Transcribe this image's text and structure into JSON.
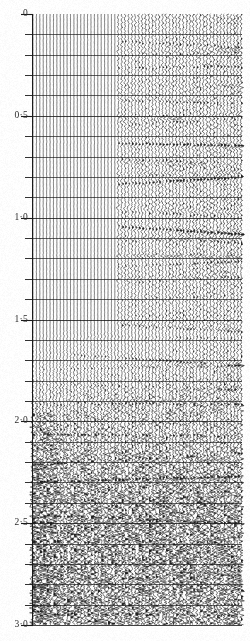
{
  "figure": {
    "kind": "seismic-section",
    "background_color": "#fefefe",
    "ink_color": "#1a1a1a",
    "width_px": 250,
    "height_px": 641
  },
  "axis": {
    "name": "two-way-travel-time",
    "orientation": "vertical",
    "units_implied": "seconds",
    "decimal_separator": "·",
    "major_labels": [
      "0",
      "0·5",
      "1·0",
      "1·5",
      "2·0",
      "2·5",
      "3·0"
    ],
    "major_values": [
      0,
      0.5,
      1.0,
      1.5,
      2.0,
      2.5,
      3.0
    ],
    "minor_interval": 0.1,
    "range": [
      0,
      3.0
    ],
    "label_x_right_px": 28,
    "axis_x_px": 32,
    "top_y_px": 14,
    "bottom_y_px": 625,
    "major_tick_length_px": 11,
    "minor_tick_length_px": 7
  },
  "chart_data": {
    "type": "line",
    "title": "",
    "xlabel": "",
    "ylabel": "Two-way travel time (s)",
    "ylim": [
      0,
      3.0
    ],
    "grid": true,
    "legend": "none",
    "traces": {
      "count": 62,
      "first_x_px": 33,
      "last_x_px": 241,
      "spacing_px": 3.4,
      "polarity": "variable-area-wiggle"
    },
    "gridlines_horizontal": {
      "interval_seconds": 0.1,
      "values": [
        0.1,
        0.2,
        0.3,
        0.4,
        0.5,
        0.6,
        0.7,
        0.8,
        0.9,
        1.0,
        1.1,
        1.2,
        1.3,
        1.4,
        1.5,
        1.6,
        1.7,
        1.8,
        1.9,
        2.0,
        2.1,
        2.2,
        2.3,
        2.4,
        2.5,
        2.6,
        2.7,
        2.8,
        2.9,
        3.0
      ]
    },
    "zones": [
      {
        "name": "quiet-upper-left",
        "x_range_px": [
          33,
          118
        ],
        "t_range_s": [
          0.0,
          1.55
        ],
        "description": "near-vertical low amplitude traces, strong horizontal ruling",
        "amplitude": 0.1,
        "noise": 0.08
      },
      {
        "name": "reflective-upper-right",
        "x_range_px": [
          118,
          241
        ],
        "t_range_s": [
          0.08,
          1.55
        ],
        "description": "coherent dark wiggle events with lateral continuity",
        "amplitude": 0.85,
        "noise": 0.35
      },
      {
        "name": "transition-mid",
        "x_range_px": [
          33,
          241
        ],
        "t_range_s": [
          1.55,
          1.95
        ],
        "description": "amplitude growth ramping toward the left edge",
        "amplitude": 0.55,
        "noise": 0.45
      },
      {
        "name": "noisy-lower",
        "x_range_px": [
          33,
          241
        ],
        "t_range_s": [
          1.95,
          3.0
        ],
        "description": "high amplitude incoherent reflections, dense banding",
        "amplitude": 1.0,
        "noise": 0.85
      }
    ],
    "reflector_events_s": [
      0.12,
      0.2,
      0.27,
      0.33,
      0.41,
      0.48,
      0.56,
      0.63,
      0.71,
      0.79,
      0.86,
      0.94,
      1.02,
      1.1,
      1.18,
      1.26,
      1.34,
      1.42,
      1.5,
      1.58,
      1.66,
      1.74,
      1.82,
      1.9,
      1.98,
      2.06,
      2.14,
      2.22,
      2.3,
      2.38,
      2.46,
      2.54,
      2.62,
      2.7,
      2.78,
      2.86,
      2.94
    ]
  }
}
